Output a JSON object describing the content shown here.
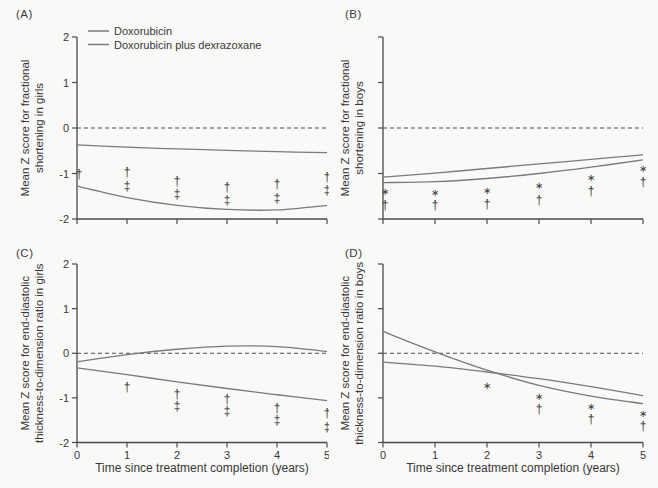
{
  "figure": {
    "xlabel": "Time since treatment completion (years)",
    "legend": [
      {
        "label": "Doxorubicin"
      },
      {
        "label": "Doxorubicin plus dexrazoxane"
      }
    ],
    "colors": {
      "background": "#f9f9f7",
      "axis": "#4a4a4a",
      "series_line": "#7a7a7a",
      "zero_dashed": "#4f4f4f",
      "marker": "#2b2b2b",
      "text": "#383838"
    }
  },
  "chart_data": [
    {
      "panel": "(A)",
      "type": "line",
      "ylabel_line1": "Mean Z score for fractional",
      "ylabel_line2": "shortening in girls",
      "xlabel": "Time since treatment completion (years)",
      "xlim": [
        0,
        5
      ],
      "ylim": [
        -2,
        2
      ],
      "yticks": [
        2,
        1,
        0,
        -1,
        -2
      ],
      "xticks": [
        0,
        1,
        2,
        3,
        4,
        5
      ],
      "show_ytick_labels": true,
      "show_xtick_labels": false,
      "zero_dashed_line": true,
      "has_legend": true,
      "series": [
        {
          "name": "Doxorubicin",
          "points": [
            [
              0,
              -1.28
            ],
            [
              1,
              -1.53
            ],
            [
              2,
              -1.7
            ],
            [
              3,
              -1.79
            ],
            [
              4,
              -1.8
            ],
            [
              5,
              -1.7
            ]
          ]
        },
        {
          "name": "Doxorubicin plus dexrazoxane",
          "points": [
            [
              0,
              -0.37
            ],
            [
              1,
              -0.42
            ],
            [
              2,
              -0.46
            ],
            [
              3,
              -0.49
            ],
            [
              4,
              -0.52
            ],
            [
              5,
              -0.54
            ]
          ]
        }
      ],
      "sig_markers": [
        {
          "x": 0,
          "symbol": "†",
          "y": -1.02
        },
        {
          "x": 1,
          "symbol": "†",
          "y": -0.97
        },
        {
          "x": 1,
          "symbol": "‡",
          "y": -1.27
        },
        {
          "x": 2,
          "symbol": "†",
          "y": -1.17
        },
        {
          "x": 2,
          "symbol": "‡",
          "y": -1.45
        },
        {
          "x": 3,
          "symbol": "†",
          "y": -1.3
        },
        {
          "x": 3,
          "symbol": "‡",
          "y": -1.58
        },
        {
          "x": 4,
          "symbol": "†",
          "y": -1.24
        },
        {
          "x": 4,
          "symbol": "‡",
          "y": -1.53
        },
        {
          "x": 5,
          "symbol": "†",
          "y": -1.07
        },
        {
          "x": 5,
          "symbol": "‡",
          "y": -1.36
        }
      ]
    },
    {
      "panel": "(B)",
      "type": "line",
      "ylabel_line1": "Mean Z score for fractional",
      "ylabel_line2": "shortening in boys",
      "xlabel": "Time since treatment completion (years)",
      "xlim": [
        0,
        5
      ],
      "ylim": [
        -2,
        2
      ],
      "yticks": [
        2,
        1,
        0,
        -1,
        -2
      ],
      "xticks": [
        0,
        1,
        2,
        3,
        4,
        5
      ],
      "show_ytick_labels": false,
      "show_xtick_labels": false,
      "zero_dashed_line": true,
      "has_legend": false,
      "series": [
        {
          "name": "Doxorubicin",
          "points": [
            [
              0,
              -1.2
            ],
            [
              1,
              -1.18
            ],
            [
              2,
              -1.11
            ],
            [
              3,
              -1.0
            ],
            [
              4,
              -0.86
            ],
            [
              5,
              -0.7
            ]
          ]
        },
        {
          "name": "Doxorubicin plus dexrazoxane",
          "points": [
            [
              0,
              -1.08
            ],
            [
              1,
              -0.99
            ],
            [
              2,
              -0.89
            ],
            [
              3,
              -0.79
            ],
            [
              4,
              -0.69
            ],
            [
              5,
              -0.59
            ]
          ]
        }
      ],
      "sig_markers": [
        {
          "x": 0,
          "symbol": "*",
          "y": -1.4
        },
        {
          "x": 0,
          "symbol": "†",
          "y": -1.7
        },
        {
          "x": 1,
          "symbol": "*",
          "y": -1.41
        },
        {
          "x": 1,
          "symbol": "†",
          "y": -1.7
        },
        {
          "x": 2,
          "symbol": "*",
          "y": -1.37
        },
        {
          "x": 2,
          "symbol": "†",
          "y": -1.66
        },
        {
          "x": 3,
          "symbol": "*",
          "y": -1.27
        },
        {
          "x": 3,
          "symbol": "†",
          "y": -1.58
        },
        {
          "x": 4,
          "symbol": "*",
          "y": -1.09
        },
        {
          "x": 4,
          "symbol": "†",
          "y": -1.39
        },
        {
          "x": 5,
          "symbol": "*",
          "y": -0.89
        },
        {
          "x": 5,
          "symbol": "†",
          "y": -1.18
        }
      ]
    },
    {
      "panel": "(C)",
      "type": "line",
      "ylabel_line1": "Mean Z score for end-diastolic",
      "ylabel_line2": "thickness-to-dimension ratio in girls",
      "xlabel": "Time since treatment completion (years)",
      "xlim": [
        0,
        5
      ],
      "ylim": [
        -2,
        2
      ],
      "yticks": [
        2,
        1,
        0,
        -1,
        -2
      ],
      "xticks": [
        0,
        1,
        2,
        3,
        4,
        5
      ],
      "show_ytick_labels": true,
      "show_xtick_labels": true,
      "zero_dashed_line": true,
      "has_legend": false,
      "series": [
        {
          "name": "Doxorubicin",
          "points": [
            [
              0,
              -0.33
            ],
            [
              1,
              -0.48
            ],
            [
              2,
              -0.64
            ],
            [
              3,
              -0.79
            ],
            [
              4,
              -0.93
            ],
            [
              5,
              -1.06
            ]
          ]
        },
        {
          "name": "Doxorubicin plus dexrazoxane",
          "points": [
            [
              0,
              -0.19
            ],
            [
              1,
              -0.03
            ],
            [
              2,
              0.09
            ],
            [
              3,
              0.16
            ],
            [
              4,
              0.15
            ],
            [
              5,
              0.04
            ]
          ]
        }
      ],
      "sig_markers": [
        {
          "x": 1,
          "symbol": "†",
          "y": -0.75
        },
        {
          "x": 2,
          "symbol": "†",
          "y": -0.92
        },
        {
          "x": 2,
          "symbol": "‡",
          "y": -1.18
        },
        {
          "x": 3,
          "symbol": "†",
          "y": -1.03
        },
        {
          "x": 3,
          "symbol": "‡",
          "y": -1.3
        },
        {
          "x": 4,
          "symbol": "†",
          "y": -1.23
        },
        {
          "x": 4,
          "symbol": "‡",
          "y": -1.5
        },
        {
          "x": 5,
          "symbol": "†",
          "y": -1.33
        },
        {
          "x": 5,
          "symbol": "‡",
          "y": -1.65
        }
      ]
    },
    {
      "panel": "(D)",
      "type": "line",
      "ylabel_line1": "Mean Z score for end-diastolic",
      "ylabel_line2": "thickness-to-dimension ratio in boys",
      "xlabel": "Time since treatment completion (years)",
      "xlim": [
        0,
        5
      ],
      "ylim": [
        -2,
        2
      ],
      "yticks": [
        2,
        1,
        0,
        -1,
        -2
      ],
      "xticks": [
        0,
        1,
        2,
        3,
        4,
        5
      ],
      "show_ytick_labels": false,
      "show_xtick_labels": true,
      "zero_dashed_line": true,
      "has_legend": false,
      "series": [
        {
          "name": "Doxorubicin",
          "points": [
            [
              0,
              0.49
            ],
            [
              1,
              0.03
            ],
            [
              2,
              -0.38
            ],
            [
              3,
              -0.72
            ],
            [
              4,
              -0.96
            ],
            [
              5,
              -1.13
            ]
          ]
        },
        {
          "name": "Doxorubicin plus dexrazoxane",
          "points": [
            [
              0,
              -0.2
            ],
            [
              1,
              -0.29
            ],
            [
              2,
              -0.42
            ],
            [
              3,
              -0.57
            ],
            [
              4,
              -0.75
            ],
            [
              5,
              -0.95
            ]
          ]
        }
      ],
      "sig_markers": [
        {
          "x": 2,
          "symbol": "*",
          "y": -0.72
        },
        {
          "x": 3,
          "symbol": "*",
          "y": -0.97
        },
        {
          "x": 3,
          "symbol": "†",
          "y": -1.25
        },
        {
          "x": 4,
          "symbol": "*",
          "y": -1.19
        },
        {
          "x": 4,
          "symbol": "†",
          "y": -1.48
        },
        {
          "x": 5,
          "symbol": "*",
          "y": -1.36
        },
        {
          "x": 5,
          "symbol": "†",
          "y": -1.63
        }
      ]
    }
  ]
}
